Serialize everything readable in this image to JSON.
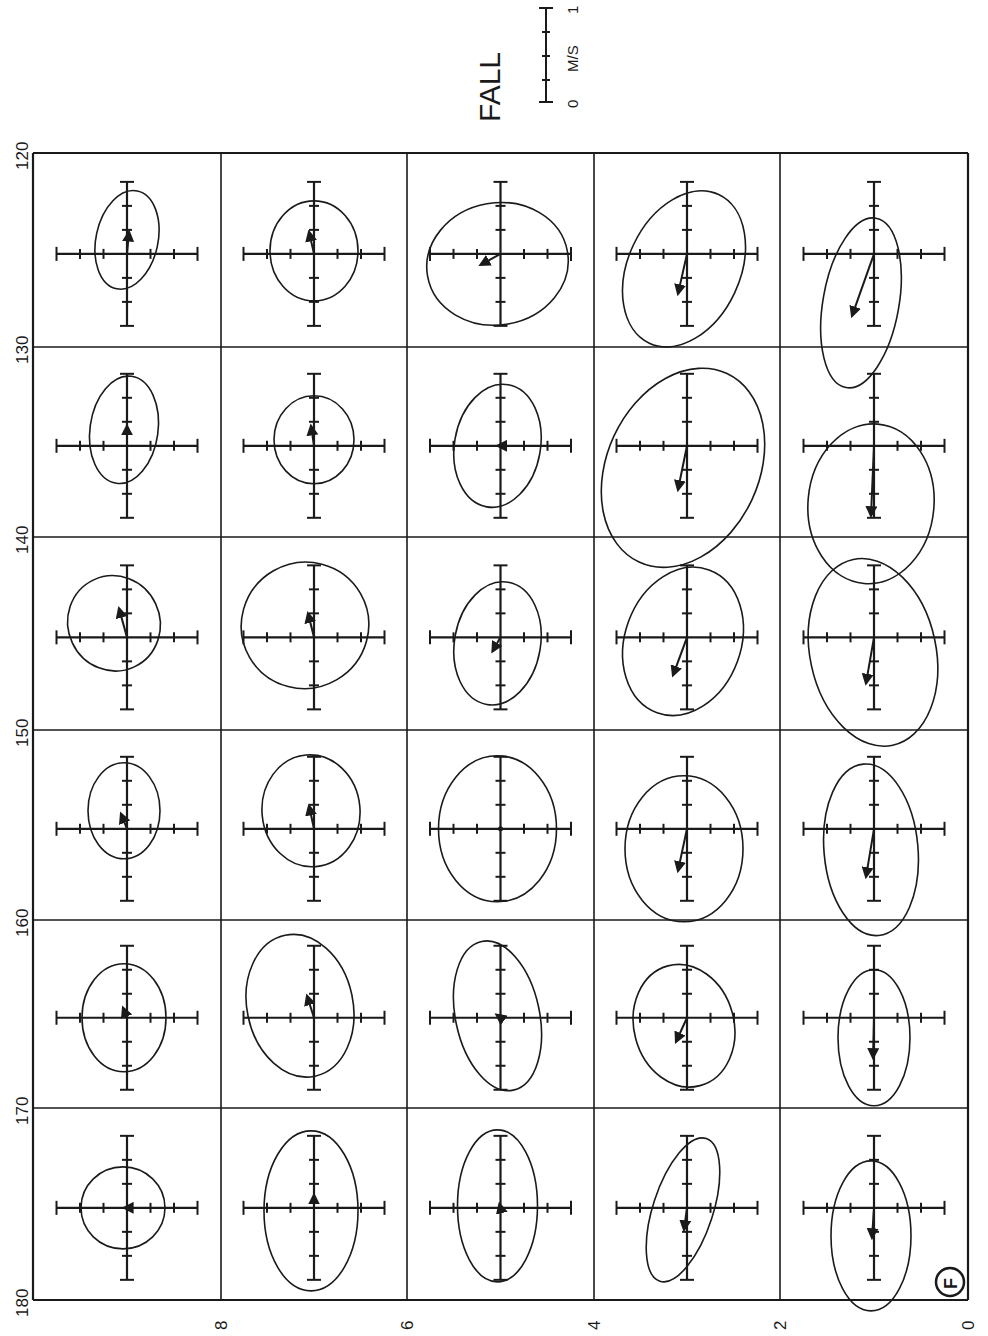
{
  "title": "FALL",
  "panel_marker": "F",
  "scale_bar": {
    "label_start": "0",
    "label_end": "1",
    "unit": "M/S",
    "ticks": 5
  },
  "colors": {
    "ink": "#1a1a1a",
    "paper": "#ffffff"
  },
  "chart_data": {
    "type": "scatter",
    "title": "FALL",
    "subtitle": "Current ellipses with mean velocity vectors (figure rotated 90°)",
    "panel": "F",
    "xlabel": "",
    "ylabel": "",
    "axis_left_ticks": [
      "120",
      "130",
      "140",
      "150",
      "160",
      "170",
      "180"
    ],
    "axis_bottom_ticks": [
      "8",
      "6",
      "4",
      "2",
      "0"
    ],
    "scale": {
      "min": 0,
      "max": 1,
      "unit": "M/S"
    },
    "grid": true,
    "columns": 5,
    "rows": 6,
    "cells": [
      {
        "row": 0,
        "col": 0,
        "range": "120-130",
        "ellipse": {
          "dx": 0,
          "dy": -14,
          "rx": 31,
          "ry": 50,
          "rot": 12
        },
        "arrow": {
          "dx": 2,
          "dy": -22
        }
      },
      {
        "row": 0,
        "col": 1,
        "range": "120-130",
        "ellipse": {
          "dx": 0,
          "dy": -3,
          "rx": 44,
          "ry": 50,
          "rot": 0
        },
        "arrow": {
          "dx": -5,
          "dy": -22
        }
      },
      {
        "row": 0,
        "col": 2,
        "range": "120-130",
        "ellipse": {
          "dx": -3,
          "dy": 10,
          "rx": 71,
          "ry": 61,
          "rot": -10
        },
        "arrow": {
          "dx": -20,
          "dy": 11
        }
      },
      {
        "row": 0,
        "col": 3,
        "range": "120-130",
        "ellipse": {
          "dx": -3,
          "dy": 15,
          "rx": 56,
          "ry": 82,
          "rot": 25
        },
        "arrow": {
          "dx": -9,
          "dy": 40
        }
      },
      {
        "row": 0,
        "col": 4,
        "range": "120-130",
        "ellipse": {
          "dx": -13,
          "dy": 49,
          "rx": 38,
          "ry": 86,
          "rot": 10
        },
        "arrow": {
          "dx": -22,
          "dy": 62
        }
      },
      {
        "row": 1,
        "col": 0,
        "range": "130-140",
        "ellipse": {
          "dx": -3,
          "dy": -16,
          "rx": 34,
          "ry": 54,
          "rot": 8
        },
        "arrow": {
          "dx": 0,
          "dy": -20
        }
      },
      {
        "row": 1,
        "col": 1,
        "range": "130-140",
        "ellipse": {
          "dx": 0,
          "dy": -6,
          "rx": 40,
          "ry": 44,
          "rot": 0
        },
        "arrow": {
          "dx": -3,
          "dy": -20
        }
      },
      {
        "row": 1,
        "col": 2,
        "range": "130-140",
        "ellipse": {
          "dx": -3,
          "dy": 0,
          "rx": 43,
          "ry": 62,
          "rot": 10
        },
        "arrow": {
          "dx": -3,
          "dy": 0
        }
      },
      {
        "row": 1,
        "col": 3,
        "range": "130-140",
        "ellipse": {
          "dx": -4,
          "dy": 22,
          "rx": 76,
          "ry": 104,
          "rot": 25
        },
        "arrow": {
          "dx": -9,
          "dy": 44
        }
      },
      {
        "row": 1,
        "col": 4,
        "range": "130-140",
        "ellipse": {
          "dx": -3,
          "dy": 58,
          "rx": 63,
          "ry": 80,
          "rot": 5
        },
        "arrow": {
          "dx": -3,
          "dy": 70
        }
      },
      {
        "row": 2,
        "col": 0,
        "range": "140-150",
        "ellipse": {
          "dx": -13,
          "dy": -14,
          "rx": 46,
          "ry": 48,
          "rot": -25
        },
        "arrow": {
          "dx": -8,
          "dy": -29
        }
      },
      {
        "row": 2,
        "col": 1,
        "range": "140-150",
        "ellipse": {
          "dx": -9,
          "dy": -12,
          "rx": 64,
          "ry": 63,
          "rot": -30
        },
        "arrow": {
          "dx": -6,
          "dy": -24
        }
      },
      {
        "row": 2,
        "col": 2,
        "range": "140-150",
        "ellipse": {
          "dx": -3,
          "dy": 6,
          "rx": 43,
          "ry": 62,
          "rot": 10
        },
        "arrow": {
          "dx": -8,
          "dy": 14
        }
      },
      {
        "row": 2,
        "col": 3,
        "range": "140-150",
        "ellipse": {
          "dx": -4,
          "dy": 4,
          "rx": 58,
          "ry": 76,
          "rot": 20
        },
        "arrow": {
          "dx": -14,
          "dy": 38
        }
      },
      {
        "row": 2,
        "col": 4,
        "range": "140-150",
        "ellipse": {
          "dx": -1,
          "dy": 15,
          "rx": 63,
          "ry": 95,
          "rot": -12
        },
        "arrow": {
          "dx": -8,
          "dy": 46
        }
      },
      {
        "row": 3,
        "col": 0,
        "range": "150-160",
        "ellipse": {
          "dx": -3,
          "dy": -18,
          "rx": 36,
          "ry": 48,
          "rot": 0
        },
        "arrow": {
          "dx": -6,
          "dy": -15
        }
      },
      {
        "row": 3,
        "col": 1,
        "range": "150-160",
        "ellipse": {
          "dx": -3,
          "dy": -18,
          "rx": 49,
          "ry": 56,
          "rot": -5
        },
        "arrow": {
          "dx": -5,
          "dy": -23
        }
      },
      {
        "row": 3,
        "col": 2,
        "range": "150-160",
        "ellipse": {
          "dx": -3,
          "dy": 0,
          "rx": 59,
          "ry": 73,
          "rot": 0
        },
        "arrow": {
          "dx": 0,
          "dy": 0
        }
      },
      {
        "row": 3,
        "col": 3,
        "range": "150-160",
        "ellipse": {
          "dx": -3,
          "dy": 20,
          "rx": 59,
          "ry": 73,
          "rot": 0
        },
        "arrow": {
          "dx": -9,
          "dy": 42
        }
      },
      {
        "row": 3,
        "col": 4,
        "range": "150-160",
        "ellipse": {
          "dx": -3,
          "dy": 21,
          "rx": 47,
          "ry": 86,
          "rot": -5
        },
        "arrow": {
          "dx": -8,
          "dy": 48
        }
      },
      {
        "row": 4,
        "col": 0,
        "range": "160-170",
        "ellipse": {
          "dx": -3,
          "dy": 0,
          "rx": 42,
          "ry": 54,
          "rot": 0
        },
        "arrow": {
          "dx": -4,
          "dy": -10
        }
      },
      {
        "row": 4,
        "col": 1,
        "range": "160-170",
        "ellipse": {
          "dx": -14,
          "dy": -12,
          "rx": 53,
          "ry": 72,
          "rot": -12
        },
        "arrow": {
          "dx": -7,
          "dy": -22
        }
      },
      {
        "row": 4,
        "col": 2,
        "range": "160-170",
        "ellipse": {
          "dx": -3,
          "dy": -2,
          "rx": 42,
          "ry": 76,
          "rot": -12
        },
        "arrow": {
          "dx": -4,
          "dy": -3
        }
      },
      {
        "row": 4,
        "col": 3,
        "range": "160-170",
        "ellipse": {
          "dx": -3,
          "dy": 8,
          "rx": 50,
          "ry": 62,
          "rot": -15
        },
        "arrow": {
          "dx": -11,
          "dy": 24
        }
      },
      {
        "row": 4,
        "col": 4,
        "range": "160-170",
        "ellipse": {
          "dx": 0,
          "dy": 20,
          "rx": 36,
          "ry": 68,
          "rot": 0
        },
        "arrow": {
          "dx": -1,
          "dy": 40
        }
      },
      {
        "row": 5,
        "col": 0,
        "range": "170-180",
        "ellipse": {
          "dx": -4,
          "dy": 0,
          "rx": 42,
          "ry": 41,
          "rot": 0
        },
        "arrow": {
          "dx": -3,
          "dy": 0
        }
      },
      {
        "row": 5,
        "col": 1,
        "range": "170-180",
        "ellipse": {
          "dx": -3,
          "dy": 3,
          "rx": 47,
          "ry": 80,
          "rot": 0
        },
        "arrow": {
          "dx": 0,
          "dy": -13
        }
      },
      {
        "row": 5,
        "col": 2,
        "range": "170-180",
        "ellipse": {
          "dx": -3,
          "dy": -2,
          "rx": 40,
          "ry": 76,
          "rot": 0
        },
        "arrow": {
          "dx": -1,
          "dy": -4
        }
      },
      {
        "row": 5,
        "col": 3,
        "range": "170-180",
        "ellipse": {
          "dx": -4,
          "dy": 2,
          "rx": 30,
          "ry": 75,
          "rot": 18
        },
        "arrow": {
          "dx": -3,
          "dy": 22
        }
      },
      {
        "row": 5,
        "col": 4,
        "range": "170-180",
        "ellipse": {
          "dx": -3,
          "dy": 28,
          "rx": 40,
          "ry": 75,
          "rot": 0
        },
        "arrow": {
          "dx": -2,
          "dy": 30
        }
      }
    ]
  }
}
